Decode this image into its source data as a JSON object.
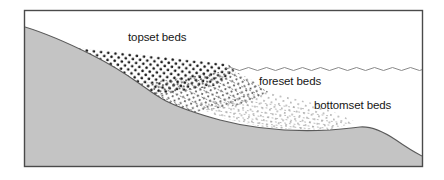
{
  "figure": {
    "kind": "delta-cross-section-diagram",
    "title": "",
    "frame": {
      "border_color": "#4a4a4a",
      "background_color": "#ffffff",
      "x": 24,
      "y": 10,
      "width": 399,
      "height": 157
    }
  },
  "colors": {
    "bedrock_fill": "#c4c4c4",
    "bedrock_outline": "#555555",
    "frame_border": "#4a4a4a",
    "water_line": "#8a8a8a",
    "label_text": "#161616",
    "topset_dots": "#1c1c1c",
    "foreset_dots": "#6b6b6b",
    "bottomset_dots": "#9a9a9a",
    "background": "#ffffff"
  },
  "labels": {
    "topset": "topset beds",
    "foreset": "foreset beds",
    "bottomset": "bottomset beds"
  },
  "features": {
    "water_surface": {
      "name": "water-surface-wavy-line",
      "y": 69,
      "x_start": 226,
      "x_end": 422,
      "style": "wavy"
    },
    "bedrock_profile": {
      "name": "bedrock-substrate",
      "description": "sloping substrate surface descending left to right"
    },
    "deposits": [
      {
        "name": "topset-beds",
        "pattern": "dense dark dot grid",
        "position": "upper left, above delta front"
      },
      {
        "name": "foreset-beds",
        "pattern": "inclined dotted laminae",
        "position": "center, dipping right"
      },
      {
        "name": "bottomset-beds",
        "pattern": "sparse faint near-horizontal dotted laminae",
        "position": "lower right, distal"
      }
    ]
  }
}
